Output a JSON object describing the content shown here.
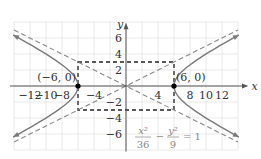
{
  "chart_data": {
    "type": "line",
    "title": "",
    "xlabel": "x",
    "ylabel": "y",
    "xlim": [
      -14,
      14
    ],
    "ylim": [
      -8,
      8
    ],
    "grid": true,
    "grid_step": 2,
    "x_tick_labels": [
      "-12",
      "-10",
      "-8",
      "-4",
      "4",
      "8",
      "10",
      "12"
    ],
    "y_tick_labels": [
      "6",
      "4",
      "2",
      "-2",
      "-4",
      "-6"
    ],
    "equation": {
      "lhs_num1": "x²",
      "lhs_den1": "36",
      "minus": "−",
      "lhs_num2": "y²",
      "lhs_den2": "9",
      "rhs": "= 1"
    },
    "a": 6,
    "b": 3,
    "vertices": [
      {
        "x": -6,
        "y": 0,
        "label": "(−6, 0)"
      },
      {
        "x": 6,
        "y": 0,
        "label": "(6, 0)"
      }
    ],
    "asymptotes": [
      {
        "slope": 0.5,
        "intercept": 0,
        "style": "dashed"
      },
      {
        "slope": -0.5,
        "intercept": 0,
        "style": "dashed"
      }
    ],
    "fundamental_rectangle": {
      "x": [
        -6,
        6
      ],
      "y": [
        -3,
        3
      ],
      "style": "dashed"
    },
    "series": [
      {
        "name": "right branch",
        "x": [
          6,
          7,
          8,
          10,
          12,
          13.5
        ],
        "y_upper": [
          0,
          1.55,
          2.0,
          4.0,
          5.2,
          6.05
        ],
        "y_lower": [
          0,
          -1.55,
          -2.0,
          -4.0,
          -5.2,
          -6.05
        ]
      },
      {
        "name": "left branch",
        "x": [
          -6,
          -7,
          -8,
          -10,
          -12,
          -13.5
        ],
        "y_upper": [
          0,
          1.55,
          2.0,
          4.0,
          5.2,
          6.05
        ],
        "y_lower": [
          0,
          -1.55,
          -2.0,
          -4.0,
          -5.2,
          -6.05
        ]
      }
    ],
    "colors": {
      "curve": "#7a7a7a",
      "asymptote": "#888888",
      "rectangle": "#222222",
      "grid": "#e3e3e3",
      "axis": "#555555",
      "vertex": "#000000"
    }
  }
}
